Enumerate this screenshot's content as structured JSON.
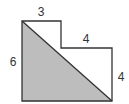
{
  "diagram": {
    "type": "geometry-figure",
    "colors": {
      "stroke": "#333333",
      "shade": "#bdbdbd",
      "background": "#ffffff"
    },
    "labels": {
      "top_width": "3",
      "step_width": "4",
      "left_height": "6",
      "right_height": "4"
    },
    "shape": {
      "outline_points": "22,21 61,21 61,48 112,48 112,101 22,101",
      "shaded_triangle_points": "22,21 112,101 22,101",
      "diagonal": {
        "x1": 22,
        "y1": 21,
        "x2": 112,
        "y2": 101
      }
    }
  }
}
